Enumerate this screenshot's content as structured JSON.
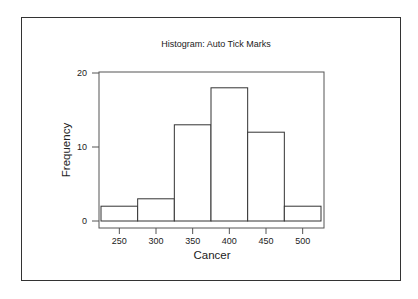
{
  "chart_data": {
    "type": "bar",
    "title": "Histogram: Auto Tick Marks",
    "xlabel": "Cancer",
    "ylabel": "Frequency",
    "categories": [
      "250",
      "300",
      "350",
      "400",
      "450",
      "500"
    ],
    "bin_edges": [
      225,
      275,
      325,
      375,
      425,
      475,
      525
    ],
    "values": [
      2,
      3,
      13,
      18,
      12,
      2
    ],
    "xticks": [
      250,
      300,
      350,
      400,
      450,
      500
    ],
    "yticks": [
      0,
      10,
      20
    ],
    "xlim": [
      220,
      530
    ],
    "ylim": [
      -1,
      20
    ],
    "grid": false,
    "legend": null
  },
  "colors": {
    "bar_fill": "#ffffff",
    "bar_stroke": "#333333",
    "frame": "#333333",
    "axis": "#555555"
  }
}
